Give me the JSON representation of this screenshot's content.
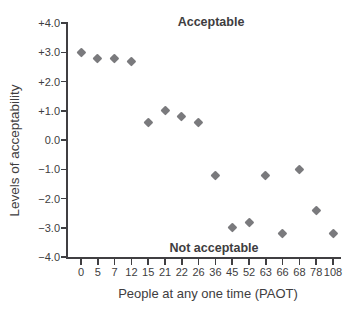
{
  "chart_data": {
    "type": "scatter",
    "title": "",
    "categories": [
      "0",
      "5",
      "7",
      "12",
      "15",
      "21",
      "22",
      "26",
      "36",
      "45",
      "52",
      "63",
      "66",
      "68",
      "78",
      "108"
    ],
    "values": [
      3.0,
      2.8,
      2.8,
      2.7,
      0.6,
      1.0,
      0.8,
      0.6,
      -1.2,
      -3.0,
      -2.8,
      -1.2,
      -3.2,
      -1.0,
      -2.4,
      -3.2
    ],
    "xlabel": "People at any one time (PAOT)",
    "ylabel": "Levels of acceptability",
    "ylim": [
      -4.0,
      4.0
    ],
    "yticks": [
      4,
      3,
      2,
      1,
      0,
      -1,
      -2,
      -3,
      -4
    ],
    "ytick_labels": [
      "+4.0",
      "+3.0",
      "+2.0",
      "+1.0",
      "0.0",
      "−1.0",
      "−2.0",
      "−3.0",
      "−4.0"
    ],
    "annotations": {
      "acceptable": "Acceptable",
      "not_acceptable": "Not acceptable"
    },
    "marker": {
      "shape": "diamond",
      "color": "#7a7a7d"
    },
    "colors": {
      "axis": "#403f42",
      "text": "#3e3d40"
    },
    "grid": false,
    "legend": null
  }
}
